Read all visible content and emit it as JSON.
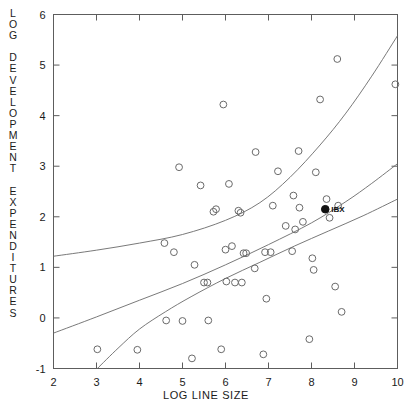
{
  "chart_data": {
    "type": "scatter",
    "title": "",
    "xlabel": "LOG LINE SIZE",
    "ylabel": "LOG DEVELOPMENT EXPENDITURES",
    "xlim": [
      2,
      10
    ],
    "ylim": [
      -1,
      6
    ],
    "xticks": [
      2,
      3,
      4,
      5,
      6,
      7,
      8,
      9,
      10
    ],
    "xtick_labels": [
      "2",
      "3",
      "4",
      "5",
      "6",
      "7",
      "8",
      "9",
      "10"
    ],
    "yticks": [
      -1,
      0,
      1,
      2,
      3,
      4,
      5,
      6
    ],
    "ytick_labels": [
      "-1",
      "0",
      "1",
      "2",
      "3",
      "4",
      "5",
      "6"
    ],
    "grid": false,
    "legend": "none",
    "marker_style": "open-circle",
    "points": [
      {
        "x": 3.02,
        "y": -0.62
      },
      {
        "x": 3.95,
        "y": -0.63
      },
      {
        "x": 4.58,
        "y": 1.48
      },
      {
        "x": 4.62,
        "y": -0.05
      },
      {
        "x": 4.8,
        "y": 1.3
      },
      {
        "x": 4.92,
        "y": 2.98
      },
      {
        "x": 5.0,
        "y": -0.06
      },
      {
        "x": 5.22,
        "y": -0.8
      },
      {
        "x": 5.28,
        "y": 1.05
      },
      {
        "x": 5.42,
        "y": 2.62
      },
      {
        "x": 5.5,
        "y": 0.7
      },
      {
        "x": 5.58,
        "y": 0.7
      },
      {
        "x": 5.6,
        "y": -0.05
      },
      {
        "x": 5.72,
        "y": 2.1
      },
      {
        "x": 5.78,
        "y": 2.15
      },
      {
        "x": 5.9,
        "y": -0.62
      },
      {
        "x": 5.95,
        "y": 4.22
      },
      {
        "x": 6.0,
        "y": 1.35
      },
      {
        "x": 6.02,
        "y": 0.72
      },
      {
        "x": 6.08,
        "y": 2.65
      },
      {
        "x": 6.15,
        "y": 1.42
      },
      {
        "x": 6.22,
        "y": 0.7
      },
      {
        "x": 6.3,
        "y": 2.12
      },
      {
        "x": 6.35,
        "y": 2.08
      },
      {
        "x": 6.38,
        "y": 0.7
      },
      {
        "x": 6.42,
        "y": 1.28
      },
      {
        "x": 6.48,
        "y": 1.28
      },
      {
        "x": 6.68,
        "y": 0.98
      },
      {
        "x": 6.7,
        "y": 3.28
      },
      {
        "x": 6.88,
        "y": -0.72
      },
      {
        "x": 6.92,
        "y": 1.3
      },
      {
        "x": 6.95,
        "y": 0.38
      },
      {
        "x": 7.05,
        "y": 1.3
      },
      {
        "x": 7.1,
        "y": 2.22
      },
      {
        "x": 7.22,
        "y": 2.9
      },
      {
        "x": 7.4,
        "y": 1.82
      },
      {
        "x": 7.55,
        "y": 1.32
      },
      {
        "x": 7.58,
        "y": 2.42
      },
      {
        "x": 7.62,
        "y": 1.75
      },
      {
        "x": 7.7,
        "y": 3.3
      },
      {
        "x": 7.72,
        "y": 2.18
      },
      {
        "x": 7.8,
        "y": 1.9
      },
      {
        "x": 7.95,
        "y": -0.42
      },
      {
        "x": 8.02,
        "y": 1.18
      },
      {
        "x": 8.05,
        "y": 0.95
      },
      {
        "x": 8.1,
        "y": 2.88
      },
      {
        "x": 8.2,
        "y": 4.32
      },
      {
        "x": 8.35,
        "y": 2.35
      },
      {
        "x": 8.42,
        "y": 1.98
      },
      {
        "x": 8.55,
        "y": 0.62
      },
      {
        "x": 8.6,
        "y": 5.12
      },
      {
        "x": 8.62,
        "y": 2.22
      },
      {
        "x": 8.7,
        "y": 0.12
      },
      {
        "x": 9.95,
        "y": 4.62
      }
    ],
    "highlighted_points": [
      {
        "x": 8.32,
        "y": 2.15,
        "label": "IBX",
        "marker": "filled-circle"
      }
    ],
    "curves": [
      {
        "name": "upper-confidence-band",
        "points": [
          [
            2.0,
            1.22
          ],
          [
            3.0,
            1.34
          ],
          [
            4.0,
            1.48
          ],
          [
            5.0,
            1.65
          ],
          [
            6.0,
            1.93
          ],
          [
            6.8,
            2.28
          ],
          [
            7.5,
            2.78
          ],
          [
            8.2,
            3.42
          ],
          [
            8.8,
            4.05
          ],
          [
            9.4,
            4.78
          ],
          [
            10.0,
            5.58
          ]
        ]
      },
      {
        "name": "regression-line",
        "points": [
          [
            2.0,
            -0.3
          ],
          [
            3.0,
            0.02
          ],
          [
            4.0,
            0.35
          ],
          [
            5.0,
            0.68
          ],
          [
            6.0,
            1.05
          ],
          [
            7.0,
            1.45
          ],
          [
            8.0,
            1.88
          ],
          [
            8.8,
            2.3
          ],
          [
            9.4,
            2.66
          ],
          [
            10.0,
            3.05
          ]
        ]
      },
      {
        "name": "lower-confidence-band",
        "points": [
          [
            3.02,
            -1.0
          ],
          [
            3.5,
            -0.6
          ],
          [
            4.0,
            -0.22
          ],
          [
            4.6,
            0.12
          ],
          [
            5.2,
            0.42
          ],
          [
            6.0,
            0.78
          ],
          [
            6.8,
            1.1
          ],
          [
            7.6,
            1.42
          ],
          [
            8.4,
            1.72
          ],
          [
            9.2,
            2.02
          ],
          [
            10.0,
            2.35
          ]
        ]
      }
    ]
  },
  "ylabel_letters": [
    "L",
    "O",
    "G",
    "",
    "D",
    "E",
    "V",
    "E",
    "L",
    "O",
    "P",
    "M",
    "E",
    "N",
    "T",
    "",
    "E",
    "X",
    "P",
    "E",
    "N",
    "D",
    "I",
    "T",
    "U",
    "R",
    "E",
    "S"
  ]
}
